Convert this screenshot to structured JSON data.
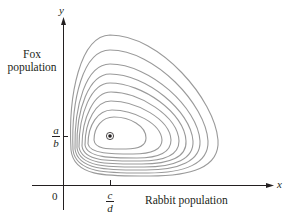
{
  "diagram": {
    "type": "phase-portrait",
    "axes": {
      "y_letter": "y",
      "x_letter": "x",
      "y_label_line1": "Fox",
      "y_label_line2": "population",
      "x_label": "Rabbit population",
      "origin_label": "0",
      "x_tick": {
        "numerator": "c",
        "denominator": "d"
      },
      "y_tick": {
        "numerator": "a",
        "denominator": "b"
      }
    },
    "equilibrium": {
      "label": "(c/d, a/b)",
      "px": 110,
      "py": 136
    },
    "colors": {
      "axis": "#231f20",
      "orbit": "#9a9a9a",
      "equilibrium": "#231f20"
    },
    "orbits_count": 9
  }
}
